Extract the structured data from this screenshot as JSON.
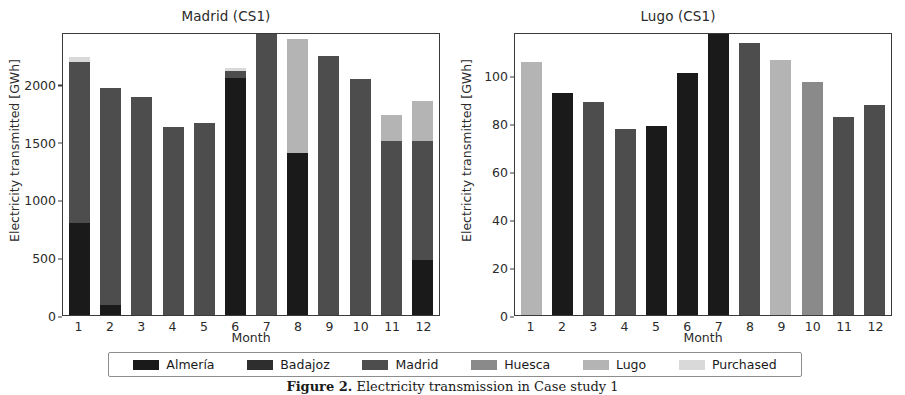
{
  "caption": {
    "prefix": "Figure 2.",
    "text": " Electricity transmission in Case study 1"
  },
  "colors": {
    "almeria": "#1a1a1a",
    "badajoz": "#2e2e2e",
    "madrid": "#4d4d4d",
    "huesca": "#8a8a8a",
    "lugo": "#b4b4b4",
    "purchased": "#d9d9d9",
    "axis": "#3a3a3a",
    "text": "#2b2b2b"
  },
  "legend": {
    "items": [
      {
        "label": "Almería",
        "color_key": "almeria",
        "color": "#1a1a1a"
      },
      {
        "label": "Badajoz",
        "color_key": "badajoz",
        "color": "#2e2e2e"
      },
      {
        "label": "Madrid",
        "color_key": "madrid",
        "color": "#4d4d4d"
      },
      {
        "label": "Huesca",
        "color_key": "huesca",
        "color": "#8a8a8a"
      },
      {
        "label": "Lugo",
        "color_key": "lugo",
        "color": "#b4b4b4"
      },
      {
        "label": "Purchased",
        "color_key": "purchased",
        "color": "#d9d9d9"
      }
    ]
  },
  "chart_data": [
    {
      "type": "bar",
      "stacked": true,
      "title": "Madrid (CS1)",
      "xlabel": "Month",
      "ylabel": "Electricity transmitted [GWh]",
      "categories": [
        "1",
        "2",
        "3",
        "4",
        "5",
        "6",
        "7",
        "8",
        "9",
        "10",
        "11",
        "12"
      ],
      "yticks": [
        0,
        500,
        1000,
        1500,
        2000
      ],
      "ylim": [
        0,
        2450
      ],
      "grid": false,
      "legend_position": "below-figure",
      "series": [
        {
          "name": "Almería",
          "color": "#1a1a1a",
          "values": [
            800,
            85,
            0,
            0,
            0,
            2050,
            0,
            1400,
            0,
            0,
            0,
            480
          ]
        },
        {
          "name": "Badajoz",
          "color": "#2e2e2e",
          "values": [
            0,
            0,
            0,
            0,
            0,
            0,
            0,
            0,
            0,
            0,
            0,
            0
          ]
        },
        {
          "name": "Madrid",
          "color": "#4d4d4d",
          "values": [
            1390,
            1880,
            1885,
            1630,
            1665,
            60,
            2450,
            0,
            2240,
            2045,
            1510,
            1030
          ]
        },
        {
          "name": "Huesca",
          "color": "#8a8a8a",
          "values": [
            0,
            0,
            0,
            0,
            0,
            0,
            0,
            0,
            0,
            0,
            0,
            0
          ]
        },
        {
          "name": "Lugo",
          "color": "#b4b4b4",
          "values": [
            0,
            0,
            0,
            0,
            0,
            0,
            0,
            990,
            0,
            0,
            225,
            340
          ]
        },
        {
          "name": "Purchased",
          "color": "#d9d9d9",
          "values": [
            40,
            0,
            0,
            0,
            0,
            25,
            0,
            0,
            0,
            0,
            0,
            0
          ]
        }
      ],
      "totals": [
        2230,
        1965,
        1885,
        1630,
        1665,
        2135,
        2450,
        2390,
        2240,
        2045,
        1735,
        1850
      ]
    },
    {
      "type": "bar",
      "stacked": true,
      "title": "Lugo (CS1)",
      "xlabel": "Month",
      "ylabel": "Electricity transmitted [GWh]",
      "categories": [
        "1",
        "2",
        "3",
        "4",
        "5",
        "6",
        "7",
        "8",
        "9",
        "10",
        "11",
        "12"
      ],
      "yticks": [
        0,
        20,
        40,
        60,
        80,
        100
      ],
      "ylim": [
        0,
        118
      ],
      "grid": false,
      "legend_position": "below-figure",
      "series": [
        {
          "name": "Almería",
          "color": "#1a1a1a",
          "values": [
            0,
            92.5,
            0,
            0,
            79,
            101,
            117.5,
            0,
            0,
            0,
            0,
            0
          ]
        },
        {
          "name": "Badajoz",
          "color": "#2e2e2e",
          "values": [
            0,
            0,
            0,
            0,
            0,
            0,
            0,
            0,
            0,
            0,
            0,
            0
          ]
        },
        {
          "name": "Madrid",
          "color": "#4d4d4d",
          "values": [
            0,
            0,
            89,
            77.5,
            0,
            0,
            0,
            113.5,
            0,
            0,
            82.5,
            87.5
          ]
        },
        {
          "name": "Huesca",
          "color": "#8a8a8a",
          "values": [
            0,
            0,
            0,
            0,
            0,
            0,
            0,
            0,
            0,
            97,
            0,
            0
          ]
        },
        {
          "name": "Lugo",
          "color": "#b4b4b4",
          "values": [
            105.5,
            0,
            0,
            0,
            0,
            0,
            0,
            0,
            106.5,
            0,
            0,
            0
          ]
        },
        {
          "name": "Purchased",
          "color": "#d9d9d9",
          "values": [
            0,
            0,
            0,
            0,
            0,
            0,
            0,
            0,
            0,
            0,
            0,
            0
          ]
        }
      ],
      "totals": [
        105.5,
        92.5,
        89,
        77.5,
        79,
        101,
        117.5,
        113.5,
        106.5,
        97,
        82.5,
        87.5
      ]
    }
  ]
}
